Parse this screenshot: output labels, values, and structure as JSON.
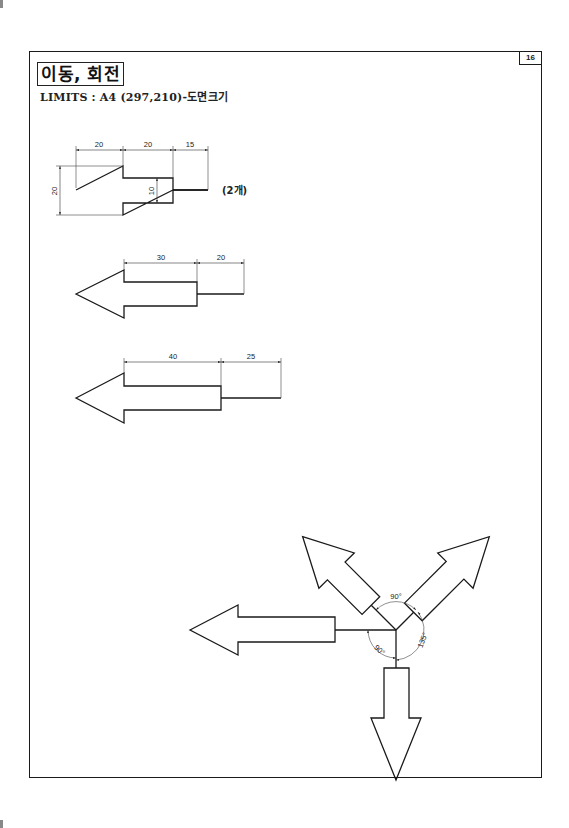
{
  "page": {
    "title": "이동, 회전",
    "limits": "LIMITS : A4 (297,210)-도면크기",
    "page_number": "16"
  },
  "figures": {
    "arrow1": {
      "dims": {
        "head_len": "20",
        "shaft_len": "20",
        "tail_len": "15",
        "head_width": "20",
        "shaft_width": "10"
      },
      "note": "(2개)"
    },
    "arrow2": {
      "dims": {
        "shaft_len": "30",
        "tail_len": "20"
      }
    },
    "arrow3": {
      "dims": {
        "shaft_len": "40",
        "tail_len": "25"
      }
    },
    "rotation": {
      "angles": {
        "top": "90°",
        "left_bottom": "90°",
        "right": "135°"
      }
    }
  },
  "colors": {
    "line": "#1a1a1a",
    "dim_line": "#333333",
    "background": "#ffffff"
  }
}
